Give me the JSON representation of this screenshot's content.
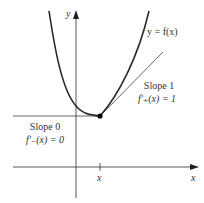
{
  "diagram": {
    "curve_label": "y = f(x)",
    "y_axis_label": "y",
    "x_axis_label": "x",
    "x_tick_label": "x",
    "right_tangent": {
      "line1": "Slope 1",
      "line2": "f'₊(x) = 1"
    },
    "left_tangent": {
      "line1": "Slope 0",
      "line2": "f'₋(x) = 0"
    },
    "colors": {
      "curve": "#2a2a2a",
      "axes": "#444444",
      "tangent": "#555555",
      "point": "#000000"
    }
  }
}
